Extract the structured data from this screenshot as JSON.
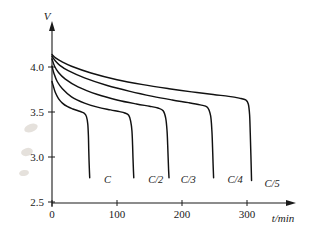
{
  "chart_data": {
    "type": "line",
    "title": "",
    "subtitle": "",
    "xlabel": "t/min",
    "ylabel": "V",
    "xlim": [
      0,
      360
    ],
    "ylim": [
      2.5,
      4.35
    ],
    "xticks": [
      "0",
      "100",
      "200",
      "300"
    ],
    "xtick_values": [
      0,
      100,
      200,
      300
    ],
    "yticks": [
      "4.0",
      "3.5",
      "3.0",
      "2.5"
    ],
    "ytick_values": [
      4.0,
      3.5,
      3.0,
      2.5
    ],
    "grid": false,
    "legend_position": "inline-end-of-curve",
    "annotations": [
      "C",
      "C/2",
      "C/3",
      "C/4",
      "C/5"
    ],
    "series": [
      {
        "name": "C",
        "label": "C",
        "label_x": 80,
        "label_y": 2.72,
        "color": "#111111",
        "x": [
          0,
          2,
          5,
          10,
          16,
          24,
          32,
          40,
          46,
          50,
          53,
          55,
          56,
          56.5,
          57,
          57.5,
          58
        ],
        "y": [
          3.85,
          3.8,
          3.73,
          3.66,
          3.61,
          3.57,
          3.545,
          3.525,
          3.51,
          3.495,
          3.46,
          3.38,
          3.25,
          3.1,
          2.97,
          2.87,
          2.78
        ]
      },
      {
        "name": "C/2",
        "label": "C/2",
        "label_x": 148,
        "label_y": 2.72,
        "color": "#111111",
        "x": [
          0,
          3,
          8,
          16,
          30,
          50,
          70,
          90,
          104,
          112,
          118,
          121,
          123,
          124,
          124.6,
          125.2,
          125.8
        ],
        "y": [
          4.02,
          3.94,
          3.85,
          3.77,
          3.68,
          3.61,
          3.565,
          3.535,
          3.515,
          3.5,
          3.475,
          3.41,
          3.3,
          3.14,
          3.0,
          2.88,
          2.78
        ]
      },
      {
        "name": "C/3",
        "label": "C/3",
        "label_x": 198,
        "label_y": 2.72,
        "color": "#111111",
        "x": [
          0,
          4,
          10,
          20,
          40,
          70,
          100,
          130,
          150,
          163,
          171,
          175,
          177,
          178,
          178.7,
          179.3,
          180
        ],
        "y": [
          4.1,
          4.02,
          3.95,
          3.88,
          3.79,
          3.705,
          3.645,
          3.6,
          3.575,
          3.555,
          3.525,
          3.44,
          3.3,
          3.14,
          3.0,
          2.88,
          2.78
        ]
      },
      {
        "name": "C/4",
        "label": "C/4",
        "label_x": 270,
        "label_y": 2.72,
        "color": "#111111",
        "x": [
          0,
          5,
          12,
          25,
          50,
          85,
          120,
          155,
          185,
          210,
          228,
          239,
          244,
          246,
          247,
          247.8,
          248.6
        ],
        "y": [
          4.13,
          4.08,
          4.03,
          3.97,
          3.89,
          3.805,
          3.74,
          3.685,
          3.645,
          3.615,
          3.59,
          3.565,
          3.47,
          3.3,
          3.12,
          2.94,
          2.78
        ]
      },
      {
        "name": "C/5",
        "label": "C/5",
        "label_x": 327,
        "label_y": 2.68,
        "color": "#111111",
        "x": [
          0,
          6,
          15,
          30,
          60,
          100,
          140,
          180,
          215,
          248,
          272,
          288,
          298,
          302,
          304,
          305,
          306,
          307
        ],
        "y": [
          4.15,
          4.11,
          4.07,
          4.02,
          3.945,
          3.87,
          3.815,
          3.77,
          3.735,
          3.705,
          3.685,
          3.665,
          3.645,
          3.6,
          3.48,
          3.28,
          3.03,
          2.75
        ]
      }
    ]
  },
  "axes": {
    "y_axis_title": "V",
    "x_axis_title": "t/min"
  }
}
